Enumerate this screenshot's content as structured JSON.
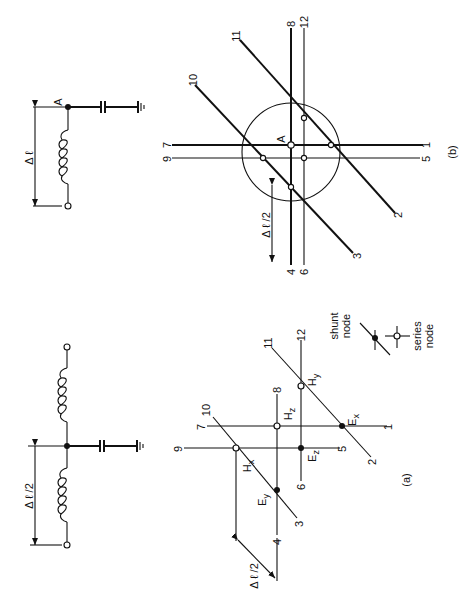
{
  "figure": {
    "orientation": "rotated 90 degrees counter-clockwise",
    "panel_a": {
      "caption": "(a)",
      "circuit": {
        "dimension_label": "Δ ℓ /2",
        "components": [
          "inductor",
          "inductor",
          "capacitor",
          "ground"
        ],
        "terminals": [
          "open-circle",
          "open-circle"
        ],
        "junction": "filled-dot"
      },
      "lattice": {
        "line_labels": [
          "1",
          "2",
          "3",
          "4",
          "5",
          "6",
          "7",
          "8",
          "9",
          "10",
          "11",
          "12"
        ],
        "nodes": [
          {
            "label": "H",
            "sub": "x",
            "type": "series"
          },
          {
            "label": "H",
            "sub": "y",
            "type": "series"
          },
          {
            "label": "H",
            "sub": "z",
            "type": "series"
          },
          {
            "label": "E",
            "sub": "x",
            "type": "shunt"
          },
          {
            "label": "E",
            "sub": "y",
            "type": "shunt"
          },
          {
            "label": "E",
            "sub": "z",
            "type": "shunt"
          }
        ],
        "dimension_label": "Δ ℓ /2"
      },
      "legend": {
        "shunt": {
          "line1": "shunt",
          "line2": "node"
        },
        "series": {
          "line1": "series",
          "line2": "node"
        }
      }
    },
    "panel_b": {
      "caption": "(b)",
      "circuit": {
        "node_label": "A",
        "dimension_label": "Δ ℓ",
        "components": [
          "inductor",
          "capacitor",
          "ground"
        ],
        "terminals": [
          "open-circle"
        ],
        "junction": "filled-dot"
      },
      "lattice": {
        "node_label": "A",
        "line_labels": [
          "1",
          "2",
          "3",
          "4",
          "5",
          "6",
          "7",
          "8",
          "9",
          "10",
          "11",
          "12"
        ],
        "dimension_label": "Δ ℓ /2"
      }
    }
  }
}
